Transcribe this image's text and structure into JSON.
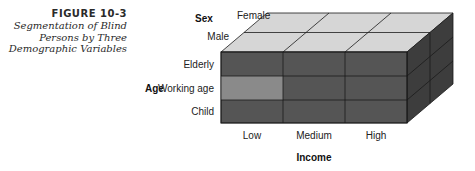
{
  "figure": {
    "number": "FIGURE 10-3",
    "title_lines": [
      "Segmentation of Blind",
      "Persons by Three",
      "Demographic Variables"
    ]
  },
  "cube": {
    "dimensions": {
      "sex": {
        "label": "Sex",
        "values": [
          "Female",
          "Male"
        ]
      },
      "age": {
        "label": "Age",
        "values": [
          "Elderly",
          "Working age",
          "Child"
        ]
      },
      "income": {
        "label": "Income",
        "values": [
          "Low",
          "Medium",
          "High"
        ]
      }
    },
    "highlighted_segment": {
      "age": "Working age",
      "income": "Low",
      "sex": "Male"
    },
    "colors": {
      "top_face": "#d6d6d6",
      "front_face": "#555555",
      "highlight": "#8a8a8a",
      "right_face": "#3d3d3d",
      "edge": "#1a1a1a"
    }
  }
}
